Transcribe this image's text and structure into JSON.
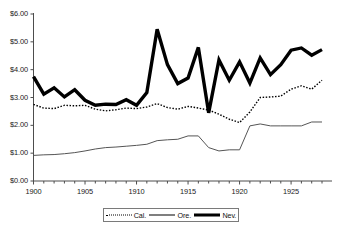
{
  "chart_data": {
    "type": "line",
    "title": "",
    "xlabel": "",
    "ylabel": "",
    "xlim": [
      1900,
      1928
    ],
    "ylim": [
      0,
      6
    ],
    "y_tick_labels": [
      "$0.00",
      "$1.00",
      "$2.00",
      "$3.00",
      "$4.00",
      "$5.00",
      "$6.00"
    ],
    "y_tick_values": [
      0,
      1,
      2,
      3,
      4,
      5,
      6
    ],
    "x_tick_labels": [
      "1900",
      "1905",
      "1910",
      "1915",
      "1920",
      "1925"
    ],
    "x_tick_values": [
      1900,
      1905,
      1910,
      1915,
      1920,
      1925
    ],
    "x_minor_tick_step": 1,
    "grid": false,
    "legend_position": "bottom-center",
    "x": [
      1900,
      1901,
      1902,
      1903,
      1904,
      1905,
      1906,
      1907,
      1908,
      1909,
      1910,
      1911,
      1912,
      1913,
      1914,
      1915,
      1916,
      1917,
      1918,
      1919,
      1920,
      1921,
      1922,
      1923,
      1924,
      1925,
      1926,
      1927,
      1928
    ],
    "series": [
      {
        "name": "Cal.",
        "style": "dotted",
        "width": 1.4,
        "color": "#000000",
        "values": [
          2.75,
          2.62,
          2.6,
          2.72,
          2.7,
          2.72,
          2.58,
          2.52,
          2.56,
          2.62,
          2.6,
          2.66,
          2.78,
          2.64,
          2.58,
          2.68,
          2.62,
          2.55,
          2.4,
          2.22,
          2.1,
          2.48,
          3.0,
          3.02,
          3.05,
          3.3,
          3.42,
          3.3,
          3.62
        ]
      },
      {
        "name": "Ore.",
        "style": "solid",
        "width": 1.0,
        "color": "#555555",
        "values": [
          0.92,
          0.94,
          0.95,
          0.98,
          1.02,
          1.08,
          1.15,
          1.2,
          1.22,
          1.25,
          1.28,
          1.32,
          1.45,
          1.48,
          1.5,
          1.62,
          1.62,
          1.2,
          1.08,
          1.12,
          1.12,
          1.98,
          2.05,
          1.98,
          1.98,
          1.98,
          1.98,
          2.12,
          2.12
        ]
      },
      {
        "name": "Nev.",
        "style": "solid",
        "width": 3.4,
        "color": "#000000",
        "values": [
          3.75,
          3.12,
          3.35,
          3.02,
          3.28,
          2.9,
          2.72,
          2.76,
          2.75,
          2.92,
          2.72,
          3.18,
          5.45,
          4.18,
          3.5,
          3.7,
          4.8,
          2.45,
          4.35,
          3.62,
          4.28,
          3.52,
          4.42,
          3.82,
          4.18,
          4.7,
          4.78,
          4.52,
          4.72
        ]
      }
    ]
  },
  "legend": {
    "entries": [
      {
        "label": "Cal.",
        "icon": "dotted-line-swatch"
      },
      {
        "label": "Ore.",
        "icon": "thin-line-swatch"
      },
      {
        "label": "Nev.",
        "icon": "thick-line-swatch"
      }
    ]
  },
  "axes": {
    "y_labels": [
      "$6.00",
      "$5.00",
      "$4.00",
      "$3.00",
      "$2.00",
      "$1.00",
      "$0.00"
    ],
    "x_labels": [
      "1900",
      "1905",
      "1910",
      "1915",
      "1920",
      "1925"
    ]
  }
}
